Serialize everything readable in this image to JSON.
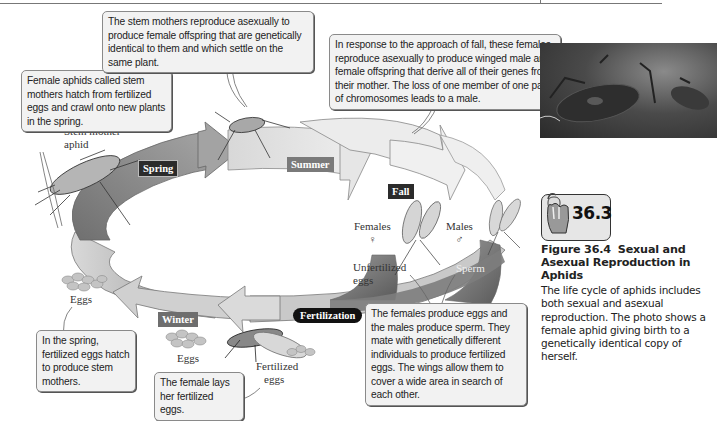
{
  "figure": {
    "number": "Figure 36.4",
    "title": "Sexual and Asexual Reproduction in Aphids",
    "caption": "The life cycle of aphids includes both sexual and asexual reproduction. The photo shows a female aphid giving birth to a genetically identical copy of herself.",
    "badge_number": "36.3",
    "badge_icon": "hand-mouse-icon"
  },
  "diagram": {
    "seasons": [
      "Spring",
      "Summer",
      "Fall",
      "Winter",
      "Fertilization"
    ],
    "labels": {
      "stem_mother_line1": "Stem mother",
      "stem_mother_line2": "aphid",
      "females": "Females",
      "females_symbol": "♀",
      "males": "Males",
      "males_symbol": "♂",
      "unfertilized_line1": "Unfertilized",
      "unfertilized_line2": "eggs",
      "sperm": "Sperm",
      "eggs_left": "Eggs",
      "eggs_winter": "Eggs",
      "fertilized_line1": "Fertilized",
      "fertilized_line2": "eggs"
    },
    "callouts": {
      "stem_mothers_hatch": "Female aphids called stem mothers hatch from fertilized eggs and crawl onto new plants in the spring.",
      "stem_mothers_reproduce": "The stem mothers reproduce asexually to produce female offspring that are genetically identical to them and which settle on the same plant.",
      "fall_response": "In response to the approach of fall, these females reproduce asexually to produce winged male and female offspring that derive all of their genes from their mother. The loss of one member of one pair of chromosomes leads to a male.",
      "mating": "The females produce eggs and the males produce sperm. They mate with genetically different individuals to produce fertilized eggs. The wings allow them to cover a wide area in search of each other.",
      "spring_hatch": "In the spring, fertilized eggs hatch to produce stem mothers.",
      "lays_eggs": "The female lays her fertilized eggs."
    },
    "colors": {
      "spring_arrow": "#8c8c8c",
      "summer_arrow": "#e2e2e2",
      "fall_arrow": "#ededed",
      "winter_arrow": "#bdbdbd",
      "dark_branch": "#6e6e6e",
      "label_dark": "#2b2b2b",
      "label_mid": "#7a7a7a"
    }
  }
}
